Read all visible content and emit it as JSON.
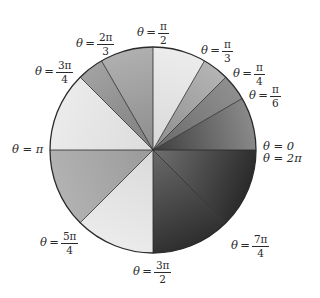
{
  "diagram": {
    "type": "unit-circle-sectors",
    "center": [
      153,
      150
    ],
    "radius": 103,
    "sectors": [
      {
        "from_deg": 0,
        "to_deg": 30,
        "fill_outer": "#8a8a8a",
        "fill_inner": "#3e3e3e"
      },
      {
        "from_deg": 30,
        "to_deg": 45,
        "fill_outer": "#8f8f8f",
        "fill_inner": "#6a6a6a"
      },
      {
        "from_deg": 45,
        "to_deg": 60,
        "fill_outer": "#b4b4b4",
        "fill_inner": "#8e8e8e"
      },
      {
        "from_deg": 60,
        "to_deg": 90,
        "fill_outer": "#ececec",
        "fill_inner": "#d8d8d8"
      },
      {
        "from_deg": 90,
        "to_deg": 120,
        "fill_outer": "#b0b0b0",
        "fill_inner": "#8c8c8c"
      },
      {
        "from_deg": 120,
        "to_deg": 135,
        "fill_outer": "#a2a2a2",
        "fill_inner": "#7e7e7e"
      },
      {
        "from_deg": 135,
        "to_deg": 180,
        "fill_outer": "#ebebeb",
        "fill_inner": "#dcdcdc"
      },
      {
        "from_deg": 180,
        "to_deg": 225,
        "fill_outer": "#b2b2b2",
        "fill_inner": "#9a9a9a"
      },
      {
        "from_deg": 225,
        "to_deg": 270,
        "fill_outer": "#ebebeb",
        "fill_inner": "#dadada"
      },
      {
        "from_deg": 270,
        "to_deg": 315,
        "fill_outer": "#2e2e2e",
        "fill_inner": "#6a6a6a"
      },
      {
        "from_deg": 315,
        "to_deg": 360,
        "fill_outer": "#2a2a2a",
        "fill_inner": "#707070"
      }
    ],
    "stroke_color": "#2a2a2a"
  },
  "labels": {
    "theta": "θ",
    "eq": "=",
    "angles": [
      {
        "id": "pi-over-2",
        "num": "π",
        "den": "2"
      },
      {
        "id": "2pi-over-3",
        "num": "2π",
        "den": "3"
      },
      {
        "id": "3pi-over-4",
        "num": "3π",
        "den": "4"
      },
      {
        "id": "pi-over-3",
        "num": "π",
        "den": "3"
      },
      {
        "id": "pi-over-4",
        "num": "π",
        "den": "4"
      },
      {
        "id": "pi-over-6",
        "num": "π",
        "den": "6"
      },
      {
        "id": "5pi-over-4",
        "num": "5π",
        "den": "4"
      },
      {
        "id": "3pi-over-2",
        "num": "3π",
        "den": "2"
      },
      {
        "id": "7pi-over-4",
        "num": "7π",
        "den": "4"
      }
    ],
    "zero_line1": "θ = 0",
    "zero_line2": "θ = 2π",
    "pi_label": "θ = π"
  }
}
